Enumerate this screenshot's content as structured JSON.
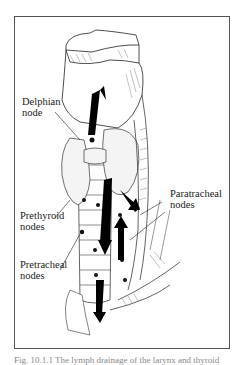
{
  "figure": {
    "type": "anatomical line illustration",
    "labels": [
      {
        "id": "delphian",
        "line1": "Delphian",
        "line2": "node"
      },
      {
        "id": "prethyroid",
        "line1": "Prethyroid",
        "line2": "nodes"
      },
      {
        "id": "pretracheal",
        "line1": "Pretracheal",
        "line2": "nodes"
      },
      {
        "id": "paratracheal",
        "line1": "Paratracheal",
        "line2": "nodes"
      }
    ],
    "caption": "Fig. 10.1.1  The lymph drainage of the larynx and thyroid"
  }
}
